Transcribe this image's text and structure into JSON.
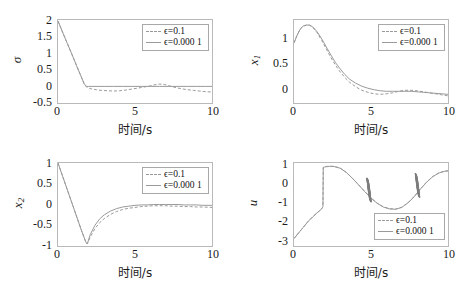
{
  "figure": {
    "background": "#ffffff",
    "curve_color": "#9a9a9a",
    "axis_color": "#b9b9b9",
    "chatter_color": "#7d7d7d"
  },
  "legend": {
    "entries": [
      {
        "label": "ϵ=0.1",
        "style": "dashed"
      },
      {
        "label": "ϵ=0.000 1",
        "style": "solid"
      }
    ]
  },
  "common": {
    "xlabel": "时间/s",
    "xticks": [
      "0",
      "5",
      "10"
    ],
    "xlim": [
      0,
      10
    ]
  },
  "chart_data": [
    {
      "type": "line",
      "name": "sigma-plot",
      "title": "",
      "xlabel": "时间/s",
      "ylabel": "σ",
      "xlim": [
        0,
        10
      ],
      "ylim": [
        -0.5,
        2
      ],
      "xticks": [
        0,
        5,
        10
      ],
      "yticks": [
        -0.5,
        0,
        0.5,
        1,
        1.5,
        2
      ],
      "ytick_labels": [
        "-0.5",
        "0",
        "0.5",
        "1",
        "1.5",
        "2"
      ],
      "grid": false,
      "legend_position": "top-right",
      "series": [
        {
          "name": "ϵ=0.1",
          "style": "dashed",
          "x": [
            0,
            0.3,
            0.6,
            0.9,
            1.2,
            1.5,
            1.7,
            1.85,
            2.0,
            2.2,
            2.5,
            2.8,
            3.2,
            3.6,
            4.0,
            4.4,
            4.8,
            5.2,
            5.6,
            6.0,
            6.3,
            6.6,
            6.9,
            7.2,
            7.6,
            8.0,
            8.4,
            8.8,
            9.2,
            9.6,
            10.0
          ],
          "y": [
            1.97,
            1.63,
            1.3,
            0.97,
            0.63,
            0.3,
            0.08,
            -0.02,
            -0.05,
            -0.08,
            -0.1,
            -0.12,
            -0.13,
            -0.14,
            -0.13,
            -0.11,
            -0.08,
            -0.05,
            -0.02,
            0.02,
            0.05,
            0.07,
            0.06,
            0.02,
            -0.03,
            -0.07,
            -0.1,
            -0.12,
            -0.14,
            -0.16,
            -0.17
          ]
        },
        {
          "name": "ϵ=0.000 1",
          "style": "solid",
          "x": [
            0,
            0.3,
            0.6,
            0.9,
            1.2,
            1.5,
            1.7,
            1.85,
            2.0,
            2.4,
            3.0,
            3.6,
            4.2,
            4.8,
            5.4,
            6.0,
            6.6,
            7.2,
            7.8,
            8.4,
            9.0,
            9.6,
            10.0
          ],
          "y": [
            1.97,
            1.63,
            1.3,
            0.97,
            0.63,
            0.3,
            0.08,
            0.0,
            0.0,
            0.0,
            0.0,
            0.0,
            0.0,
            0.0,
            0.0,
            0.0,
            0.0,
            0.0,
            0.0,
            0.0,
            0.0,
            0.0,
            0.0
          ]
        }
      ]
    },
    {
      "type": "line",
      "name": "x1-plot",
      "title": "",
      "xlabel": "时间/s",
      "ylabel": "x1",
      "xlim": [
        0,
        10
      ],
      "ylim": [
        -0.18,
        1.45
      ],
      "xticks": [
        0,
        5,
        10
      ],
      "yticks": [
        0,
        0.5,
        1
      ],
      "ytick_labels": [
        "0",
        "0.5",
        "1"
      ],
      "grid": false,
      "legend_position": "top-right",
      "series": [
        {
          "name": "ϵ=0.1",
          "style": "dashed",
          "x": [
            0,
            0.2,
            0.4,
            0.6,
            0.8,
            1.0,
            1.2,
            1.5,
            1.8,
            2.1,
            2.4,
            2.7,
            3.0,
            3.3,
            3.6,
            4.0,
            4.4,
            4.8,
            5.2,
            5.6,
            6.0,
            6.4,
            6.8,
            7.2,
            7.6,
            8.0,
            8.4,
            8.8,
            9.2,
            9.6,
            10.0
          ],
          "y": [
            1.0,
            1.15,
            1.27,
            1.33,
            1.35,
            1.35,
            1.31,
            1.2,
            1.05,
            0.88,
            0.71,
            0.56,
            0.43,
            0.32,
            0.23,
            0.14,
            0.07,
            0.03,
            0.0,
            -0.01,
            0.0,
            0.02,
            0.05,
            0.07,
            0.07,
            0.06,
            0.04,
            0.02,
            0.0,
            -0.02,
            -0.04
          ]
        },
        {
          "name": "ϵ=0.000 1",
          "style": "solid",
          "x": [
            0,
            0.2,
            0.4,
            0.6,
            0.8,
            1.0,
            1.2,
            1.5,
            1.8,
            2.1,
            2.4,
            2.7,
            3.0,
            3.3,
            3.6,
            4.0,
            4.4,
            4.8,
            5.2,
            5.6,
            6.0,
            6.4,
            6.8,
            7.2,
            7.6,
            8.0,
            8.4,
            8.8,
            9.2,
            9.6,
            10.0
          ],
          "y": [
            1.0,
            1.15,
            1.27,
            1.33,
            1.35,
            1.35,
            1.32,
            1.22,
            1.08,
            0.92,
            0.76,
            0.61,
            0.49,
            0.38,
            0.29,
            0.21,
            0.15,
            0.11,
            0.08,
            0.06,
            0.05,
            0.05,
            0.05,
            0.05,
            0.05,
            0.04,
            0.03,
            0.02,
            0.01,
            0.0,
            -0.01
          ]
        }
      ]
    },
    {
      "type": "line",
      "name": "x2-plot",
      "title": "",
      "xlabel": "时间/s",
      "ylabel": "x2",
      "xlim": [
        0,
        10
      ],
      "ylim": [
        -1,
        1
      ],
      "xticks": [
        0,
        5,
        10
      ],
      "yticks": [
        -1,
        -0.5,
        0,
        0.5,
        1
      ],
      "ytick_labels": [
        "-1",
        "-0.5",
        "0",
        "0.5",
        "1"
      ],
      "grid": false,
      "legend_position": "top-right",
      "series": [
        {
          "name": "ϵ=0.1",
          "style": "dashed",
          "x": [
            0,
            0.3,
            0.6,
            0.9,
            1.2,
            1.5,
            1.8,
            1.9,
            2.1,
            2.4,
            2.7,
            3.0,
            3.4,
            3.8,
            4.2,
            4.6,
            5.0,
            5.4,
            5.8,
            6.2,
            6.6,
            7.0,
            7.4,
            7.8,
            8.2,
            8.6,
            9.0,
            9.4,
            10.0
          ],
          "y": [
            1.0,
            0.68,
            0.36,
            0.04,
            -0.28,
            -0.6,
            -0.9,
            -0.95,
            -0.78,
            -0.58,
            -0.44,
            -0.34,
            -0.24,
            -0.17,
            -0.12,
            -0.09,
            -0.07,
            -0.05,
            -0.04,
            -0.03,
            -0.03,
            -0.03,
            -0.04,
            -0.04,
            -0.05,
            -0.05,
            -0.06,
            -0.06,
            -0.07
          ]
        },
        {
          "name": "ϵ=0.000 1",
          "style": "solid",
          "x": [
            0,
            0.3,
            0.6,
            0.9,
            1.2,
            1.5,
            1.8,
            1.9,
            2.1,
            2.4,
            2.7,
            3.0,
            3.4,
            3.8,
            4.2,
            4.6,
            5.0,
            5.4,
            5.8,
            6.2,
            6.6,
            7.0,
            7.4,
            7.8,
            8.2,
            8.6,
            9.0,
            9.4,
            10.0
          ],
          "y": [
            1.0,
            0.68,
            0.36,
            0.04,
            -0.28,
            -0.6,
            -0.9,
            -0.95,
            -0.72,
            -0.5,
            -0.35,
            -0.25,
            -0.16,
            -0.1,
            -0.06,
            -0.04,
            -0.02,
            -0.01,
            -0.01,
            0.0,
            0.0,
            0.0,
            0.0,
            0.0,
            -0.01,
            -0.01,
            -0.01,
            -0.02,
            -0.02
          ]
        }
      ]
    },
    {
      "type": "line",
      "name": "u-plot",
      "title": "",
      "xlabel": "时间/s",
      "ylabel": "u",
      "xlim": [
        0,
        10
      ],
      "ylim": [
        -3,
        1.45
      ],
      "xticks": [
        0,
        5,
        10
      ],
      "yticks": [
        -3,
        -2,
        -1,
        0,
        1
      ],
      "ytick_labels": [
        "-3",
        "-2",
        "-1",
        "0",
        "1"
      ],
      "grid": false,
      "legend_position": "bottom-right",
      "chatter_clusters": [
        {
          "x": 4.85,
          "y_min": -0.55,
          "y_max": 0.55
        },
        {
          "x": 8.0,
          "y_min": -0.3,
          "y_max": 0.8
        }
      ],
      "series": [
        {
          "name": "ϵ=0.1",
          "style": "dashed",
          "x": [
            0,
            0.3,
            0.6,
            0.9,
            1.2,
            1.5,
            1.75,
            1.88,
            1.9,
            2.0,
            2.3,
            2.6,
            3.0,
            3.4,
            3.8,
            4.2,
            4.6,
            5.0,
            5.4,
            5.8,
            6.2,
            6.6,
            7.0,
            7.4,
            7.8,
            8.2,
            8.6,
            9.0,
            9.4,
            9.8,
            10.0
          ],
          "y": [
            -2.6,
            -2.3,
            -2.0,
            -1.7,
            -1.45,
            -1.22,
            -1.05,
            -0.9,
            1.22,
            1.25,
            1.28,
            1.27,
            1.18,
            0.95,
            0.63,
            0.28,
            -0.08,
            -0.42,
            -0.7,
            -0.9,
            -1.0,
            -1.02,
            -0.92,
            -0.68,
            -0.35,
            0.05,
            0.42,
            0.72,
            0.92,
            1.02,
            1.03
          ]
        },
        {
          "name": "ϵ=0.000 1",
          "style": "solid",
          "x": [
            0,
            0.3,
            0.6,
            0.9,
            1.2,
            1.5,
            1.75,
            1.88,
            1.9,
            2.0,
            2.3,
            2.6,
            3.0,
            3.4,
            3.8,
            4.2,
            4.6,
            5.0,
            5.4,
            5.8,
            6.2,
            6.6,
            7.0,
            7.4,
            7.8,
            8.2,
            8.6,
            9.0,
            9.4,
            9.8,
            10.0
          ],
          "y": [
            -2.6,
            -2.3,
            -2.0,
            -1.7,
            -1.45,
            -1.22,
            -1.05,
            -0.9,
            1.2,
            1.24,
            1.27,
            1.26,
            1.17,
            0.94,
            0.62,
            0.27,
            -0.09,
            -0.43,
            -0.71,
            -0.91,
            -1.01,
            -1.03,
            -0.93,
            -0.69,
            -0.36,
            0.04,
            0.41,
            0.71,
            0.91,
            1.01,
            1.02
          ]
        }
      ]
    }
  ]
}
